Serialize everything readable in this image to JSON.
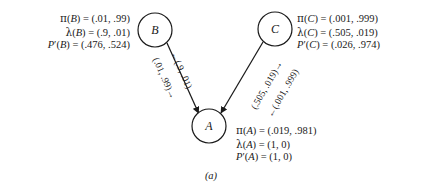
{
  "figure": {
    "caption": "(a)",
    "type": "bayesian-network-belief-propagation",
    "ink_color": "#1a1a1a",
    "background_color": "#ffffff"
  },
  "nodes": [
    {
      "id": "B",
      "label": "B",
      "cx": 155,
      "cy": 30,
      "r": 17
    },
    {
      "id": "C",
      "label": "C",
      "cx": 275,
      "cy": 29,
      "r": 17
    },
    {
      "id": "A",
      "label": "A",
      "cx": 209,
      "cy": 126,
      "r": 17
    }
  ],
  "edges": [
    {
      "id": "B-A",
      "from": "B",
      "to": "A",
      "direction": "bidirectional",
      "labels": {
        "toward_parent": "←(.9, .01)",
        "toward_child": "(.01, .99)→"
      }
    },
    {
      "id": "C-A",
      "from": "C",
      "to": "A",
      "direction": "bidirectional",
      "labels": {
        "toward_parent": "(.505, .019)→",
        "toward_child": "←(.001, .999)"
      }
    }
  ],
  "params": {
    "B": {
      "pi": {
        "symbol": "π",
        "prime": "",
        "arg": "B",
        "value": "(.01, .99)"
      },
      "lambda": {
        "symbol": "λ",
        "prime": "",
        "arg": "B",
        "value": "(.9, .01)"
      },
      "p": {
        "symbol": "P",
        "prime": "′",
        "arg": "B",
        "value": "(.476, .524)"
      }
    },
    "C": {
      "pi": {
        "symbol": "π",
        "prime": "",
        "arg": "C",
        "value": "(.001, .999)"
      },
      "lambda": {
        "symbol": "λ",
        "prime": "",
        "arg": "C",
        "value": "(.505, .019)"
      },
      "p": {
        "symbol": "P",
        "prime": "′",
        "arg": "C",
        "value": "(.026, .974)"
      }
    },
    "A": {
      "pi": {
        "symbol": "π",
        "prime": "",
        "arg": "A",
        "value": "(.019, .981)"
      },
      "lambda": {
        "symbol": "λ",
        "prime": "",
        "arg": "A",
        "value": "(1, 0)"
      },
      "p": {
        "symbol": "P",
        "prime": "′",
        "arg": "A",
        "value": "(1, 0)"
      }
    }
  },
  "equals": "=",
  "paren_open": "(",
  "paren_close": ")"
}
